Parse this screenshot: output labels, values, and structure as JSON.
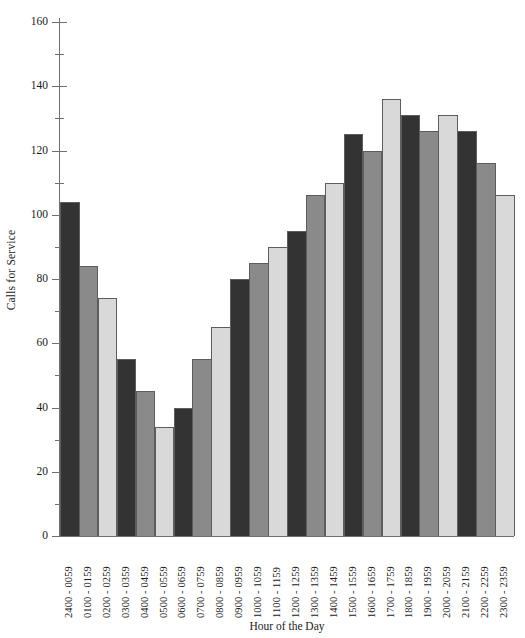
{
  "chart_data": {
    "type": "bar",
    "title": "",
    "subtitle": "",
    "xlabel": "Hour of the Day",
    "ylabel": "Calls for Service",
    "ylim": [
      0,
      160
    ],
    "yticks": [
      0,
      20,
      40,
      60,
      80,
      100,
      120,
      140,
      160
    ],
    "ytick_labels": [
      "0",
      "20",
      "40",
      "60",
      "80",
      "100",
      "120",
      "140",
      "160"
    ],
    "minor_yticks": [
      10,
      30,
      50,
      70,
      90,
      110,
      130,
      150
    ],
    "grid": false,
    "legend": "none",
    "categories": [
      "2400 - 0059",
      "0100 - 0159",
      "0200 - 0259",
      "0300 - 0359",
      "0400 - 0459",
      "0500 - 0559",
      "0600 - 0659",
      "0700 - 0759",
      "0800 - 0859",
      "0900 - 0959",
      "1000 - 1059",
      "1100 - 1159",
      "1200 - 1259",
      "1300 - 1359",
      "1400 - 1459",
      "1500 - 1559",
      "1600 - 1659",
      "1700 - 1759",
      "1800 - 1859",
      "1900 - 1959",
      "2000 - 2059",
      "2100 - 2159",
      "2200 - 2259",
      "2300 - 2359"
    ],
    "values": [
      104,
      84,
      74,
      55,
      45,
      34,
      40,
      55,
      65,
      80,
      85,
      90,
      95,
      106,
      110,
      125,
      120,
      136,
      131,
      126,
      131,
      126,
      116,
      106
    ],
    "bar_palette": [
      "#333333",
      "#8a8a8a",
      "#d9d9d9"
    ],
    "bar_border_color": "#5d5d5d",
    "axis_color": "#6f6f6f",
    "background": "#ffffff"
  }
}
